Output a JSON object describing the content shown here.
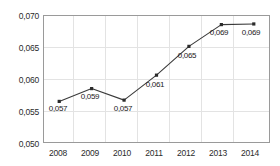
{
  "chart_data": {
    "type": "line",
    "title": "",
    "subtitle": "",
    "xlabel": "",
    "ylabel": "",
    "categories": [
      "2008",
      "2009",
      "2010",
      "2011",
      "2012",
      "2013",
      "2014"
    ],
    "values": [
      0.057,
      0.059,
      0.057,
      0.061,
      0.065,
      0.069,
      0.069
    ],
    "plotted_values": [
      0.0565,
      0.0585,
      0.0567,
      0.0606,
      0.0651,
      0.0685,
      0.0686
    ],
    "point_labels": [
      "0,057",
      "0,059",
      "0,057",
      "0,061",
      "0,065",
      "0,069",
      "0,069"
    ],
    "ylim": [
      0.05,
      0.07
    ],
    "ytick_values": [
      0.07,
      0.065,
      0.06,
      0.055,
      0.05
    ],
    "ytick_labels": [
      "0,070",
      "0,065",
      "0,060",
      "0,055",
      "0,050"
    ],
    "xtick_labels": [
      "2008",
      "2009",
      "2010",
      "2011",
      "2012",
      "2013",
      "2014"
    ],
    "decimal_separator": ",",
    "grid": true,
    "grid_axes": "both",
    "legend": false,
    "legend_position": "none",
    "series": [
      {
        "name": "",
        "values": [
          0.057,
          0.059,
          0.057,
          0.061,
          0.065,
          0.069,
          0.069
        ]
      }
    ]
  },
  "style": {
    "line_color": "#3a3a3a",
    "marker_color": "#2b2b2b",
    "grid_color": "#e3e3e3",
    "axis_color": "#9a9a9a",
    "text_color": "#2b2b2b",
    "background": "#ffffff"
  }
}
